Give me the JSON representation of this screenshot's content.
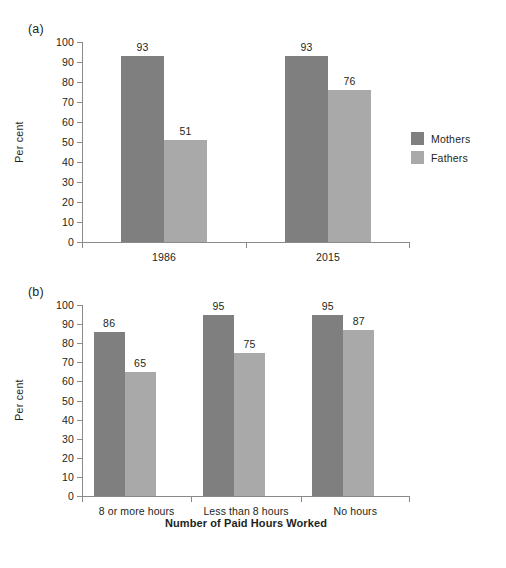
{
  "figure": {
    "panel_a_label": "(a)",
    "panel_b_label": "(b)"
  },
  "colors": {
    "mothers": "#7f7f7f",
    "fathers": "#a9a9a9",
    "axis": "#8a8a8a",
    "text": "#231f20",
    "background": "#ffffff"
  },
  "legend": {
    "mothers_label": "Mothers",
    "fathers_label": "Fathers"
  },
  "chart_data": [
    {
      "type": "bar",
      "panel": "(a)",
      "title": "",
      "xlabel": "",
      "ylabel": "Per cent",
      "ylim": [
        0,
        100
      ],
      "ytick_labels": [
        "0",
        "10",
        "20",
        "30",
        "40",
        "50",
        "60",
        "70",
        "80",
        "90",
        "100"
      ],
      "yticks": [
        0,
        10,
        20,
        30,
        40,
        50,
        60,
        70,
        80,
        90,
        100
      ],
      "grid": false,
      "legend_position": "right",
      "categories": [
        "1986",
        "2015"
      ],
      "series": [
        {
          "name": "Mothers",
          "color": "#7f7f7f",
          "values": [
            93,
            93
          ],
          "labels": [
            "93",
            "93"
          ]
        },
        {
          "name": "Fathers",
          "color": "#a9a9a9",
          "values": [
            51,
            76
          ],
          "labels": [
            "51",
            "76"
          ]
        }
      ]
    },
    {
      "type": "bar",
      "panel": "(b)",
      "title": "",
      "xlabel": "Number of Paid Hours Worked",
      "ylabel": "Per cent",
      "ylim": [
        0,
        100
      ],
      "ytick_labels": [
        "0",
        "10",
        "20",
        "30",
        "40",
        "50",
        "60",
        "70",
        "80",
        "90",
        "100"
      ],
      "yticks": [
        0,
        10,
        20,
        30,
        40,
        50,
        60,
        70,
        80,
        90,
        100
      ],
      "grid": false,
      "legend_position": "right",
      "categories": [
        "8 or more hours",
        "Less than 8 hours",
        "No hours"
      ],
      "series": [
        {
          "name": "Mothers",
          "color": "#7f7f7f",
          "values": [
            86,
            95,
            95
          ],
          "labels": [
            "86",
            "95",
            "95"
          ]
        },
        {
          "name": "Fathers",
          "color": "#a9a9a9",
          "values": [
            65,
            75,
            87
          ],
          "labels": [
            "65",
            "75",
            "87"
          ]
        }
      ]
    }
  ]
}
